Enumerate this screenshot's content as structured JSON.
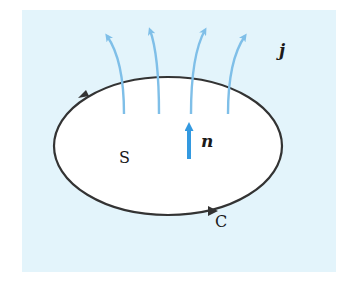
{
  "diagram": {
    "colors": {
      "panel_background": "#e3f4fb",
      "surface_fill": "#ffffff",
      "curve": "#333333",
      "current_arrows": "#7fbfe8",
      "normal_arrow": "#3399e0"
    },
    "labels": {
      "current": "j",
      "normal": "n",
      "surface": "S",
      "curve": "C"
    },
    "current_arrow_count": 4
  }
}
